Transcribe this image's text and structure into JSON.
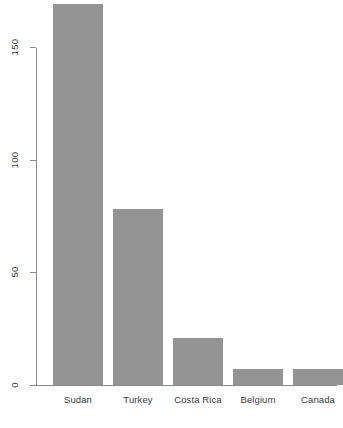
{
  "chart_data": {
    "type": "bar",
    "title": "",
    "subtitle": "",
    "xlabel": "",
    "ylabel": "",
    "categories": [
      "Sudan",
      "Turkey",
      "Costa Rica",
      "Belgium",
      "Canada"
    ],
    "values": [
      169,
      78,
      21,
      7,
      7
    ],
    "ylim": [
      0,
      169
    ],
    "y_ticks": [
      0,
      50,
      100,
      150
    ],
    "y_tick_labels": [
      "0",
      "50",
      "100",
      "150"
    ],
    "grid": false,
    "legend": false,
    "orientation": "vertical",
    "bar_color": "#949494",
    "bar_border_color": "#949494",
    "axis_color": "#8a8a8a",
    "text_color": "#3b3b3b",
    "background_color": "#ffffff",
    "y_tick_label_rotation": 90,
    "x_tick_label_rotation": 0,
    "bars": [
      {
        "category": "Sudan",
        "value": 169
      },
      {
        "category": "Turkey",
        "value": 78
      },
      {
        "category": "Costa Rica",
        "value": 21
      },
      {
        "category": "Belgium",
        "value": 7
      },
      {
        "category": "Canada",
        "value": 7
      }
    ]
  },
  "layout": {
    "baseline_y": 385,
    "plot_top_y": 0,
    "axis_x": 36,
    "pixels_per_unit": 2.2533,
    "bar_width": 50,
    "bar_gap": 10,
    "first_bar_left": 53
  }
}
